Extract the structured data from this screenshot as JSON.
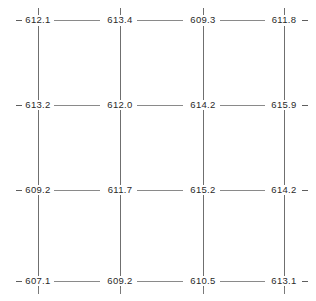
{
  "diagram": {
    "grid": {
      "columns": 4,
      "rows": 4,
      "column_x": [
        38,
        120,
        203,
        284
      ],
      "row_y": [
        20,
        105,
        190,
        281
      ]
    },
    "nodes": [
      {
        "row": 0,
        "col": 0,
        "value": "612.1"
      },
      {
        "row": 0,
        "col": 1,
        "value": "613.4"
      },
      {
        "row": 0,
        "col": 2,
        "value": "609.3"
      },
      {
        "row": 0,
        "col": 3,
        "value": "611.8"
      },
      {
        "row": 1,
        "col": 0,
        "value": "613.2"
      },
      {
        "row": 1,
        "col": 1,
        "value": "612.0"
      },
      {
        "row": 1,
        "col": 2,
        "value": "614.2"
      },
      {
        "row": 1,
        "col": 3,
        "value": "615.9"
      },
      {
        "row": 2,
        "col": 0,
        "value": "609.2"
      },
      {
        "row": 2,
        "col": 1,
        "value": "611.7"
      },
      {
        "row": 2,
        "col": 2,
        "value": "615.2"
      },
      {
        "row": 2,
        "col": 3,
        "value": "614.2"
      },
      {
        "row": 3,
        "col": 0,
        "value": "607.1"
      },
      {
        "row": 3,
        "col": 1,
        "value": "609.2"
      },
      {
        "row": 3,
        "col": 2,
        "value": "610.5"
      },
      {
        "row": 3,
        "col": 3,
        "value": "613.1"
      }
    ],
    "colors": {
      "label_text": "#2a2a2a",
      "vertical_line": "#6f6f6f",
      "horizontal_line": "#8a8a8a",
      "tick": "#7a7a7a",
      "dash": "#5f5f5f",
      "background": "#ffffff"
    }
  }
}
